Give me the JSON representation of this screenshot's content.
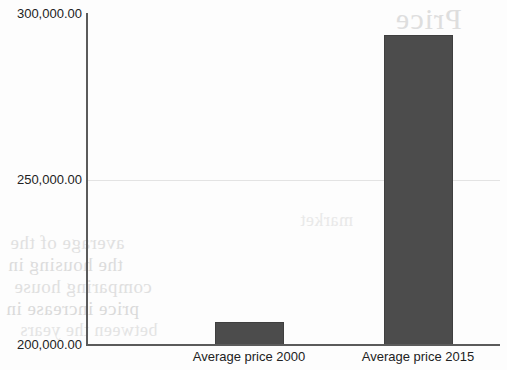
{
  "chart_data": {
    "type": "bar",
    "title": "",
    "xlabel": "",
    "ylabel": "",
    "categories": [
      "Average price 2000",
      "Average price 2015"
    ],
    "values": [
      207000,
      293800
    ],
    "ylim": [
      200000,
      300000
    ],
    "yticks": [
      200000,
      250000,
      300000
    ],
    "ytick_labels": [
      "200,000.00",
      "250,000.00",
      "300,000.00"
    ],
    "grid": true,
    "gridlines_at": [
      250000
    ],
    "legend": "none",
    "bar_color": "#4c4c4c",
    "axis_color": "#5b5b5b",
    "grid_color": "#e3e3e3",
    "background_color": "#fdfdfd"
  },
  "axes": {
    "y_ticks": [
      {
        "label": "300,000.00",
        "value": 300000
      },
      {
        "label": "250,000.00",
        "value": 250000
      },
      {
        "label": "200,000.00",
        "value": 200000
      }
    ],
    "x_ticks": [
      {
        "label": "Average price 2000"
      },
      {
        "label": "Average price 2015"
      }
    ]
  },
  "bars": [
    {
      "category": "Average price 2000",
      "value": 207000
    },
    {
      "category": "Average price 2015",
      "value": 293800
    }
  ],
  "background_bleed": {
    "line_a": "Price",
    "line_b": "average of the",
    "line_c": "the housing in",
    "line_d": "comparing house",
    "line_e": "price increase in",
    "line_f": "between the years",
    "line_g": "market"
  }
}
